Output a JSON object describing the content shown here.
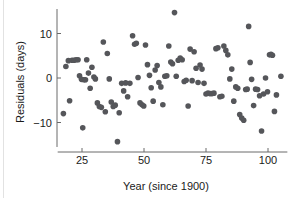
{
  "chart_data": {
    "type": "scatter",
    "title": "",
    "xlabel": "Year (since 1900)",
    "ylabel": "Residuals (days)",
    "xlim": [
      16,
      107
    ],
    "ylim": [
      -15.5,
      15.5
    ],
    "xticks": [
      25,
      50,
      75,
      100
    ],
    "yticks": [
      -10,
      0,
      10
    ],
    "xtick_labels": [
      "25",
      "50",
      "75",
      "100"
    ],
    "ytick_labels": [
      "−10",
      "0",
      "10"
    ],
    "grid": false,
    "legend": null,
    "marker": {
      "shape": "circle",
      "color": "#55565a",
      "size_px": 4.6
    },
    "n_points": 112,
    "points": [
      [
        17.5,
        -8.0
      ],
      [
        18.5,
        2.6
      ],
      [
        19.5,
        3.9
      ],
      [
        20.0,
        -5.1
      ],
      [
        21.0,
        4.0
      ],
      [
        21.8,
        4.0
      ],
      [
        22.6,
        4.1
      ],
      [
        23.4,
        4.1
      ],
      [
        24.0,
        0.5
      ],
      [
        24.8,
        -0.3
      ],
      [
        25.3,
        -11.2
      ],
      [
        25.8,
        -0.4
      ],
      [
        26.4,
        -0.4
      ],
      [
        26.9,
        4.1
      ],
      [
        27.6,
        1.1
      ],
      [
        28.3,
        -2.3
      ],
      [
        29.0,
        2.4
      ],
      [
        29.8,
        0.2
      ],
      [
        30.4,
        -0.2
      ],
      [
        31.2,
        -5.6
      ],
      [
        32.0,
        -6.4
      ],
      [
        32.8,
        -6.6
      ],
      [
        33.6,
        8.1
      ],
      [
        34.4,
        -7.6
      ],
      [
        35.2,
        5.5
      ],
      [
        36.0,
        -0.2
      ],
      [
        36.8,
        -5.4
      ],
      [
        37.6,
        -6.4
      ],
      [
        38.4,
        -6.1
      ],
      [
        39.3,
        -14.3
      ],
      [
        40.0,
        -7.8
      ],
      [
        41.0,
        -1.2
      ],
      [
        41.8,
        -2.9
      ],
      [
        42.6,
        -1.1
      ],
      [
        43.4,
        -4.2
      ],
      [
        44.3,
        -1.2
      ],
      [
        45.4,
        9.5
      ],
      [
        46.2,
        7.6
      ],
      [
        46.9,
        7.8
      ],
      [
        47.6,
        0.1
      ],
      [
        48.4,
        -5.6
      ],
      [
        49.2,
        -6.0
      ],
      [
        49.9,
        -6.3
      ],
      [
        50.6,
        7.4
      ],
      [
        51.4,
        3.0
      ],
      [
        52.2,
        0.6
      ],
      [
        52.9,
        -2.2
      ],
      [
        53.7,
        -5.2
      ],
      [
        54.5,
        1.8
      ],
      [
        55.3,
        2.8
      ],
      [
        56.0,
        -1.0
      ],
      [
        56.8,
        -2.0
      ],
      [
        57.6,
        -6.0
      ],
      [
        58.4,
        0.4
      ],
      [
        59.2,
        0.5
      ],
      [
        60.0,
        7.2
      ],
      [
        60.8,
        3.6
      ],
      [
        61.5,
        3.2
      ],
      [
        62.3,
        14.7
      ],
      [
        63.0,
        0.4
      ],
      [
        63.8,
        4.0
      ],
      [
        64.6,
        4.5
      ],
      [
        65.4,
        4.1
      ],
      [
        66.2,
        -0.8
      ],
      [
        67.0,
        -0.5
      ],
      [
        67.8,
        -6.3
      ],
      [
        68.6,
        6.5
      ],
      [
        69.4,
        -0.6
      ],
      [
        70.2,
        5.9
      ],
      [
        71.0,
        2.2
      ],
      [
        71.8,
        -1.0
      ],
      [
        72.6,
        2.9
      ],
      [
        73.4,
        2.0
      ],
      [
        74.2,
        -1.2
      ],
      [
        75.0,
        -3.6
      ],
      [
        75.8,
        -3.4
      ],
      [
        76.6,
        -3.5
      ],
      [
        77.4,
        -3.5
      ],
      [
        78.2,
        -3.4
      ],
      [
        79.0,
        6.6
      ],
      [
        79.8,
        6.8
      ],
      [
        80.6,
        -4.2
      ],
      [
        81.4,
        -4.1
      ],
      [
        82.2,
        7.2
      ],
      [
        83.0,
        6.2
      ],
      [
        83.8,
        5.2
      ],
      [
        84.6,
        -0.2
      ],
      [
        85.4,
        2.0
      ],
      [
        86.2,
        -5.2
      ],
      [
        87.0,
        -2.0
      ],
      [
        87.8,
        -2.3
      ],
      [
        88.6,
        -8.2
      ],
      [
        89.4,
        -9.0
      ],
      [
        90.2,
        -9.5
      ],
      [
        91.0,
        -2.6
      ],
      [
        91.6,
        -2.5
      ],
      [
        92.2,
        11.6
      ],
      [
        92.8,
        3.5
      ],
      [
        93.4,
        -0.3
      ],
      [
        94.2,
        -6.2
      ],
      [
        95.0,
        -2.5
      ],
      [
        95.8,
        -2.6
      ],
      [
        96.6,
        -4.0
      ],
      [
        97.4,
        -11.9
      ],
      [
        98.2,
        -3.6
      ],
      [
        99.0,
        0.0
      ],
      [
        99.8,
        -3.1
      ],
      [
        100.6,
        5.2
      ],
      [
        101.2,
        5.3
      ],
      [
        101.8,
        5.1
      ],
      [
        102.6,
        -7.5
      ],
      [
        103.4,
        -3.8
      ],
      [
        105.2,
        0.4
      ]
    ]
  }
}
